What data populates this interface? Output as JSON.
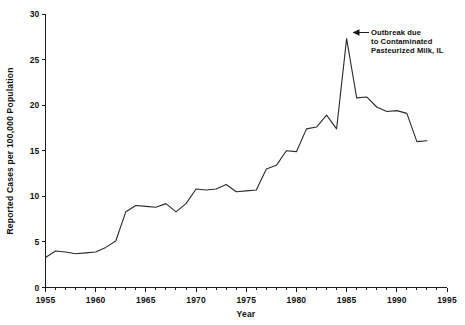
{
  "chart_data": {
    "type": "line",
    "title": "",
    "xlabel": "Year",
    "ylabel": "Reported Cases per 100,000 Population",
    "xlim": [
      1955,
      1995
    ],
    "ylim": [
      0,
      30
    ],
    "grid": false,
    "legend": "none",
    "x_ticks_major": [
      "1955",
      "1960",
      "1965",
      "1970",
      "1975",
      "1980",
      "1985",
      "1990",
      "1995"
    ],
    "x_tick_values": [
      1955,
      1960,
      1965,
      1970,
      1975,
      1980,
      1985,
      1990,
      1995
    ],
    "y_ticks_major": [
      "0",
      "5",
      "10",
      "15",
      "20",
      "25",
      "30"
    ],
    "y_tick_values": [
      0,
      5,
      10,
      15,
      20,
      25,
      30
    ],
    "x_minor_interval": 1,
    "x": [
      1955,
      1956,
      1957,
      1958,
      1959,
      1960,
      1961,
      1962,
      1963,
      1964,
      1965,
      1966,
      1967,
      1968,
      1969,
      1970,
      1971,
      1972,
      1973,
      1974,
      1975,
      1976,
      1977,
      1978,
      1979,
      1980,
      1981,
      1982,
      1983,
      1984,
      1985,
      1986,
      1987,
      1988,
      1989,
      1990,
      1991,
      1992,
      1993
    ],
    "values": [
      3.3,
      4.0,
      3.9,
      3.7,
      3.8,
      3.9,
      4.4,
      5.1,
      8.3,
      9.0,
      8.9,
      8.8,
      9.2,
      8.3,
      9.2,
      10.8,
      10.7,
      10.8,
      11.3,
      10.5,
      10.6,
      10.7,
      13.0,
      13.4,
      15.0,
      14.9,
      17.4,
      17.6,
      18.9,
      17.4,
      27.3,
      20.8,
      20.9,
      19.8,
      19.3,
      19.4,
      19.1,
      16.0,
      16.1
    ],
    "series": [
      {
        "name": "Reported Cases per 100,000 Population",
        "values": [
          3.3,
          4.0,
          3.9,
          3.7,
          3.8,
          3.9,
          4.4,
          5.1,
          8.3,
          9.0,
          8.9,
          8.8,
          9.2,
          8.3,
          9.2,
          10.8,
          10.7,
          10.8,
          11.3,
          10.5,
          10.6,
          10.7,
          13.0,
          13.4,
          15.0,
          14.9,
          17.4,
          17.6,
          18.9,
          17.4,
          27.3,
          20.8,
          20.9,
          19.8,
          19.3,
          19.4,
          19.1,
          16.0,
          16.1
        ]
      }
    ],
    "annotations": [
      {
        "name": "outbreak-annotation",
        "lines": [
          "Outbreak due",
          "to Contaminated",
          "Pasteurized Milk, IL"
        ],
        "points_to_year": 1985,
        "points_to_value": 27.3
      }
    ],
    "colors": {
      "line": "#2b2b2b",
      "axis": "#1a1a1a",
      "text": "#111111",
      "background": "#ffffff"
    }
  }
}
